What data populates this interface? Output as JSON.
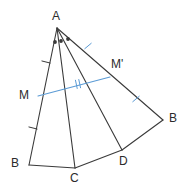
{
  "figure": {
    "type": "geometry-diagram",
    "canvas": {
      "width": 188,
      "height": 192
    },
    "colors": {
      "stroke": "#3a3a3a",
      "accent": "#5b9bd5",
      "label": "#2b2b2b",
      "background": "#ffffff"
    },
    "points": {
      "A": {
        "label": "A",
        "x": 57,
        "y": 28,
        "label_x": 52,
        "label_y": 10
      },
      "B": {
        "label": "B",
        "x": 29,
        "y": 165,
        "label_x": 11,
        "label_y": 157
      },
      "C": {
        "label": "C",
        "x": 75,
        "y": 168,
        "label_x": 70,
        "label_y": 172
      },
      "D": {
        "label": "D",
        "x": 122,
        "y": 150,
        "label_x": 119,
        "label_y": 155
      },
      "B2": {
        "label": "B",
        "x": 163,
        "y": 120,
        "label_x": 169,
        "label_y": 112
      },
      "M": {
        "label": "M",
        "x": 38,
        "y": 96,
        "label_x": 19,
        "label_y": 89
      },
      "M2": {
        "label": "M'",
        "x": 110,
        "y": 77,
        "label_x": 111,
        "label_y": 58
      }
    },
    "segments": [
      {
        "name": "ray-A-B",
        "from": "A",
        "to": "B"
      },
      {
        "name": "ray-A-C",
        "from": "A",
        "to": "C"
      },
      {
        "name": "ray-A-D",
        "from": "A",
        "to": "D"
      },
      {
        "name": "ray-A-B2",
        "from": "A",
        "to": "B2"
      },
      {
        "name": "side-B-C",
        "from": "B",
        "to": "C"
      },
      {
        "name": "side-C-D",
        "from": "C",
        "to": "D"
      },
      {
        "name": "side-D-B2",
        "from": "D",
        "to": "B2"
      }
    ],
    "midline": {
      "name": "segment-M-Mprime",
      "from": "M",
      "to": "M2",
      "color": "accent"
    },
    "angle_dots": [
      {
        "x": 55,
        "y": 42
      },
      {
        "x": 61,
        "y": 41
      },
      {
        "x": 68,
        "y": 39
      }
    ],
    "tick_marks": [
      {
        "name": "tick-AM",
        "x": 46,
        "y": 62,
        "angle": 14,
        "count": 1,
        "color": "stroke"
      },
      {
        "name": "tick-MB",
        "x": 33,
        "y": 128,
        "angle": 14,
        "count": 1,
        "color": "stroke"
      },
      {
        "name": "tick-AMprime",
        "x": 88,
        "y": 46,
        "angle": -40,
        "count": 1,
        "color": "accent"
      },
      {
        "name": "tick-MprimeB",
        "x": 136,
        "y": 99,
        "angle": -40,
        "count": 1,
        "color": "accent"
      },
      {
        "name": "tick-midline",
        "x": 78,
        "y": 84,
        "angle": 78,
        "count": 2,
        "color": "accent"
      }
    ]
  }
}
